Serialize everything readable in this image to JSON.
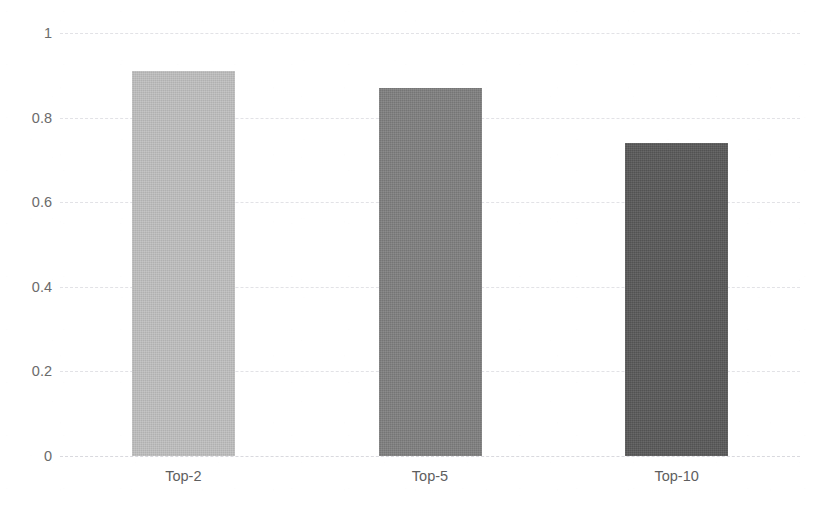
{
  "chart_data": {
    "type": "bar",
    "title": "",
    "subtitle": "",
    "xlabel": "",
    "ylabel": "",
    "categories": [
      "Top-2",
      "Top-5",
      "Top-10"
    ],
    "values": [
      0.91,
      0.87,
      0.74
    ],
    "series": [
      {
        "name": "",
        "values": [
          0.91,
          0.87,
          0.74
        ]
      }
    ],
    "ylim": [
      0,
      1
    ],
    "ytick_labels": [
      "0",
      "0.2",
      "0.4",
      "0.6",
      "0.8",
      "1"
    ],
    "ytick_values": [
      0,
      0.2,
      0.4,
      0.6,
      0.8,
      1
    ],
    "grid": true,
    "grid_axis": "y",
    "legend": false,
    "legend_position": "none",
    "bar_colors": [
      "#bfbfbf",
      "#7f7f7f",
      "#595959"
    ],
    "background_color": "#ffffff",
    "grid_color": "#e2e2e6",
    "axis_text_color": "#6b6b6b"
  },
  "axes": {
    "y": {
      "ticks": [
        {
          "label": "1",
          "value": 1
        },
        {
          "label": "0.8",
          "value": 0.8
        },
        {
          "label": "0.6",
          "value": 0.6
        },
        {
          "label": "0.4",
          "value": 0.4
        },
        {
          "label": "0.2",
          "value": 0.2
        },
        {
          "label": "0",
          "value": 0
        }
      ]
    },
    "x": {
      "ticks": [
        {
          "label": "Top-2"
        },
        {
          "label": "Top-5"
        },
        {
          "label": "Top-10"
        }
      ]
    }
  },
  "title_remnant": {
    "text": "·"
  }
}
